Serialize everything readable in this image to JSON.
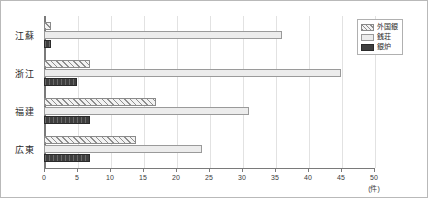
{
  "chart_data": {
    "type": "bar",
    "orientation": "horizontal",
    "title": "",
    "subtitle": "",
    "xlabel": "(件)",
    "ylabel": "",
    "xlim": [
      0,
      50
    ],
    "xticks": [
      0,
      5,
      10,
      15,
      20,
      25,
      30,
      35,
      40,
      45,
      50
    ],
    "xtick_labels": [
      "0",
      "5",
      "10",
      "15",
      "20",
      "25",
      "30",
      "35",
      "40",
      "45",
      "50"
    ],
    "unit_label": "(件)",
    "grid": true,
    "grid_axis": "x",
    "legend_position": "top-right",
    "categories": [
      "江蘇",
      "浙江",
      "福建",
      "広東"
    ],
    "series": [
      {
        "name": "外国銀",
        "style": "hatched-diagonal",
        "color": "#f2f2f2",
        "values": [
          1,
          7,
          17,
          14
        ]
      },
      {
        "name": "銭荘",
        "style": "light-solid",
        "color": "#ececec",
        "values": [
          36,
          45,
          31,
          24
        ]
      },
      {
        "name": "銀炉",
        "style": "dark-solid",
        "color": "#3f3f3f",
        "values": [
          1,
          5,
          7,
          7
        ]
      }
    ]
  },
  "legend": {
    "items": [
      {
        "label": "外国銀"
      },
      {
        "label": "銭荘"
      },
      {
        "label": "銀炉"
      }
    ]
  },
  "axis": {
    "unit": "(件)"
  }
}
